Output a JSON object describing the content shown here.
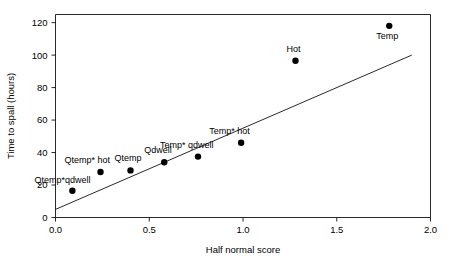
{
  "chart_data": {
    "type": "scatter",
    "title": "",
    "xlabel": "Half normal score",
    "ylabel": "Time to spall (hours)",
    "xlim": [
      0.0,
      2.0
    ],
    "ylim": [
      0,
      125
    ],
    "grid": false,
    "legend": "none",
    "xticks": [
      "0.0",
      "0.5",
      "1.0",
      "1.5",
      "2.0"
    ],
    "xtick_values": [
      0.0,
      0.5,
      1.0,
      1.5,
      2.0
    ],
    "yticks": [
      "0",
      "20",
      "40",
      "60",
      "80",
      "100",
      "120"
    ],
    "ytick_values": [
      0,
      20,
      40,
      60,
      80,
      100,
      120
    ],
    "points": [
      {
        "label": "Qtemp*qdwell",
        "x": 0.09,
        "y": 16.5,
        "label_dx": -38,
        "label_dy": -8,
        "label_anchor": "start"
      },
      {
        "label": "Qtemp* hot",
        "x": 0.24,
        "y": 28.0,
        "label_dx": -36,
        "label_dy": -9,
        "label_anchor": "start"
      },
      {
        "label": "Qtemp",
        "x": 0.4,
        "y": 29.0,
        "label_dx": -16,
        "label_dy": -9,
        "label_anchor": "start"
      },
      {
        "label": "Qdwell",
        "x": 0.58,
        "y": 34.0,
        "label_dx": -20,
        "label_dy": -9,
        "label_anchor": "start"
      },
      {
        "label": "Temp* qdwell",
        "x": 0.76,
        "y": 37.5,
        "label_dx": -38,
        "label_dy": -9,
        "label_anchor": "start"
      },
      {
        "label": "Temp* hot",
        "x": 0.99,
        "y": 46.0,
        "label_dx": -32,
        "label_dy": -9,
        "label_anchor": "start"
      },
      {
        "label": "Hot",
        "x": 1.28,
        "y": 96.5,
        "label_dx": -9,
        "label_dy": -9,
        "label_anchor": "start"
      },
      {
        "label": "Temp",
        "x": 1.78,
        "y": 118.0,
        "label_dx": -13,
        "label_dy": 13,
        "label_anchor": "start"
      }
    ],
    "fit_line": {
      "name": "reference line",
      "x_start": 0.0,
      "y_start": 5.0,
      "x_end": 1.9,
      "y_end": 100.0
    }
  },
  "axes": {
    "x_title": "Half normal score",
    "y_title": "Time to spall (hours)"
  }
}
